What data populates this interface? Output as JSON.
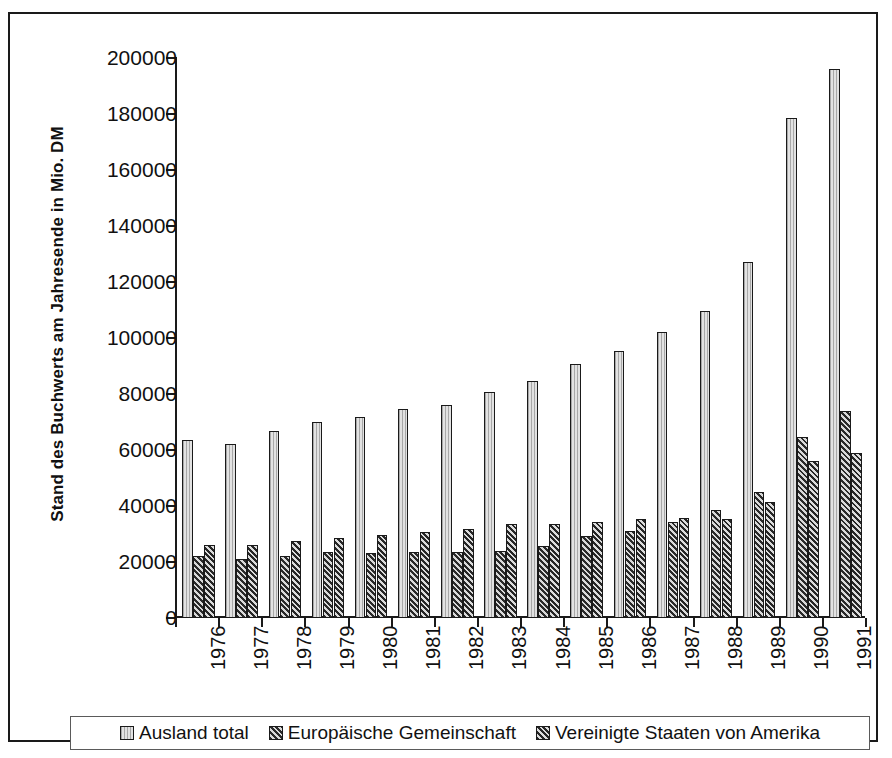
{
  "chart_data": {
    "type": "bar",
    "title": "",
    "xlabel": "",
    "ylabel": "Stand des Buchwerts am Jahresende in Mio. DM",
    "ylim": [
      0,
      200000
    ],
    "ytick_step": 20000,
    "yticks": [
      "200000",
      "180000",
      "160000",
      "140000",
      "120000",
      "100000",
      "80000",
      "60000",
      "40000",
      "20000",
      "0"
    ],
    "grid": false,
    "legend_position": "bottom",
    "categories": [
      "1976",
      "1977",
      "1978",
      "1979",
      "1980",
      "1981",
      "1982",
      "1983",
      "1984",
      "1985",
      "1986",
      "1987",
      "1988",
      "1989",
      "1990",
      "1991"
    ],
    "series": [
      {
        "name": "Ausland total",
        "pattern": "light-dotted",
        "color": "#e2e2e2",
        "values": [
          63500,
          62300,
          66700,
          70000,
          71700,
          74700,
          76200,
          80800,
          84500,
          90600,
          95300,
          102100,
          109500,
          127000,
          178500,
          196000
        ]
      },
      {
        "name": "Europäische Gemeinschaft",
        "pattern": "diagonal-hatch",
        "color": "#6d6d6d",
        "values": [
          22100,
          21200,
          22300,
          23400,
          23200,
          23500,
          23400,
          24000,
          25600,
          29400,
          31000,
          34400,
          38400,
          45000,
          64700,
          73800
        ]
      },
      {
        "name": "Vereinigte Staaten von Amerika",
        "pattern": "cross-hatch",
        "color": "#555555",
        "values": [
          26200,
          26000,
          27600,
          28500,
          29600,
          30600,
          31900,
          33500,
          33400,
          34200,
          35200,
          35700,
          35400,
          41400,
          55900,
          58900
        ]
      }
    ]
  },
  "legend": {
    "items": [
      {
        "label": "Ausland total"
      },
      {
        "label": "Europäische Gemeinschaft"
      },
      {
        "label": "Vereinigte Staaten von Amerika"
      }
    ]
  }
}
